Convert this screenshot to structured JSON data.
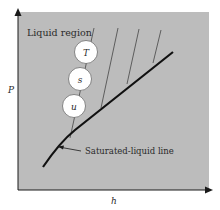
{
  "diagram": {
    "axes": {
      "y_label": "P",
      "x_label": "h"
    },
    "region_label": "Liquid region",
    "curve_label": "Saturated-liquid line",
    "circles": [
      {
        "label": "T"
      },
      {
        "label": "s"
      },
      {
        "label": "u"
      }
    ],
    "colors": {
      "background_panel": "#b9b9b9",
      "line": "#1a1a1a",
      "circle_fill": "#ffffff"
    }
  }
}
